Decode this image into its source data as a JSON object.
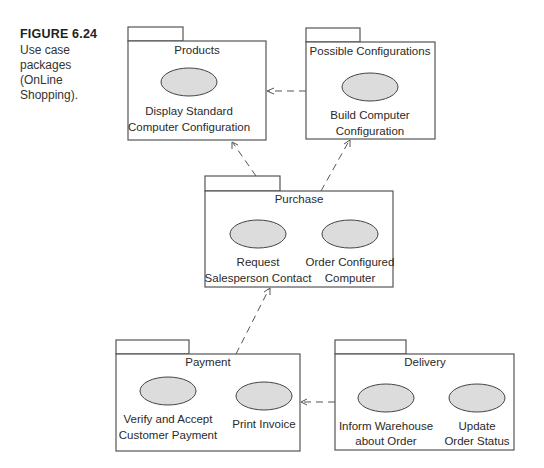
{
  "caption": {
    "figure": "FIGURE 6.24",
    "lines": [
      "Use case",
      "packages",
      "(OnLine",
      "Shopping)."
    ]
  },
  "packages": {
    "products": {
      "name": "Products",
      "use_cases": [
        {
          "line1": "Display Standard",
          "line2": "Computer Configuration"
        }
      ]
    },
    "possible_configurations": {
      "name": "Possible Configurations",
      "use_cases": [
        {
          "line1": "Build Computer",
          "line2": "Configuration"
        }
      ]
    },
    "purchase": {
      "name": "Purchase",
      "use_cases": [
        {
          "line1": "Request",
          "line2": "Salesperson Contact"
        },
        {
          "line1": "Order Configured",
          "line2": "Computer"
        }
      ]
    },
    "payment": {
      "name": "Payment",
      "use_cases": [
        {
          "line1": "Verify and Accept",
          "line2": "Customer Payment"
        },
        {
          "line1": "Print Invoice",
          "line2": ""
        }
      ]
    },
    "delivery": {
      "name": "Delivery",
      "use_cases": [
        {
          "line1": "Inform Warehouse",
          "line2": "about Order"
        },
        {
          "line1": "Update",
          "line2": "Order Status"
        }
      ]
    }
  },
  "dependencies": [
    {
      "from": "Possible Configurations",
      "to": "Products"
    },
    {
      "from": "Purchase",
      "to": "Products"
    },
    {
      "from": "Purchase",
      "to": "Possible Configurations"
    },
    {
      "from": "Payment",
      "to": "Purchase"
    },
    {
      "from": "Delivery",
      "to": "Payment"
    }
  ]
}
